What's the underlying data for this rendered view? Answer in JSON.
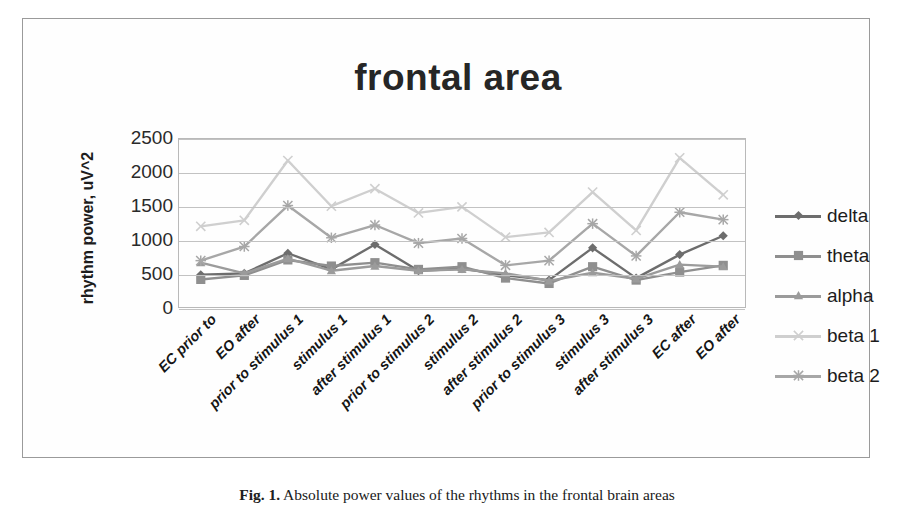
{
  "figure": {
    "caption_label": "Fig. 1.",
    "caption_text": "Absolute power values of the rhythms in the frontal brain areas"
  },
  "chart_data": {
    "type": "line",
    "title": "frontal area",
    "xlabel": "",
    "ylabel": "rhythm power, uV^2",
    "ylim": [
      0,
      2500
    ],
    "ytick_values": [
      0,
      500,
      1000,
      1500,
      2000,
      2500
    ],
    "ytick_labels": [
      "0",
      "500",
      "1000",
      "1500",
      "2000",
      "2500"
    ],
    "grid": true,
    "legend_position": "right",
    "categories": [
      "EC prior to",
      "EO after",
      "prior to stimulus 1",
      "stimulus 1",
      "after stimulus 1",
      "prior to stimulus 2",
      "stimulus 2",
      "after stimulus 2",
      "prior to stimulus 3",
      "stimulus 3",
      "after stimulus 3",
      "EC after",
      "EO after"
    ],
    "series": [
      {
        "name": "delta",
        "marker": "diamond",
        "color": "#6d6d6d",
        "values": [
          480,
          500,
          800,
          560,
          930,
          540,
          570,
          470,
          400,
          880,
          430,
          780,
          1060
        ]
      },
      {
        "name": "theta",
        "marker": "square",
        "color": "#8f8f8f",
        "values": [
          410,
          470,
          700,
          610,
          660,
          560,
          600,
          430,
          350,
          600,
          400,
          520,
          620
        ]
      },
      {
        "name": "alpha",
        "marker": "triangle",
        "color": "#9b9b9b",
        "values": [
          660,
          500,
          720,
          540,
          610,
          540,
          560,
          500,
          390,
          510,
          420,
          630,
          600
        ]
      },
      {
        "name": "beta 1",
        "marker": "x",
        "color": "#cfcfcf",
        "values": [
          1200,
          1290,
          2180,
          1500,
          1760,
          1400,
          1490,
          1040,
          1110,
          1710,
          1140,
          2220,
          1670
        ]
      },
      {
        "name": "beta 2",
        "marker": "asterisk",
        "color": "#a7a7a7",
        "values": [
          690,
          900,
          1510,
          1030,
          1220,
          950,
          1020,
          620,
          690,
          1240,
          760,
          1410,
          1300
        ]
      }
    ]
  }
}
